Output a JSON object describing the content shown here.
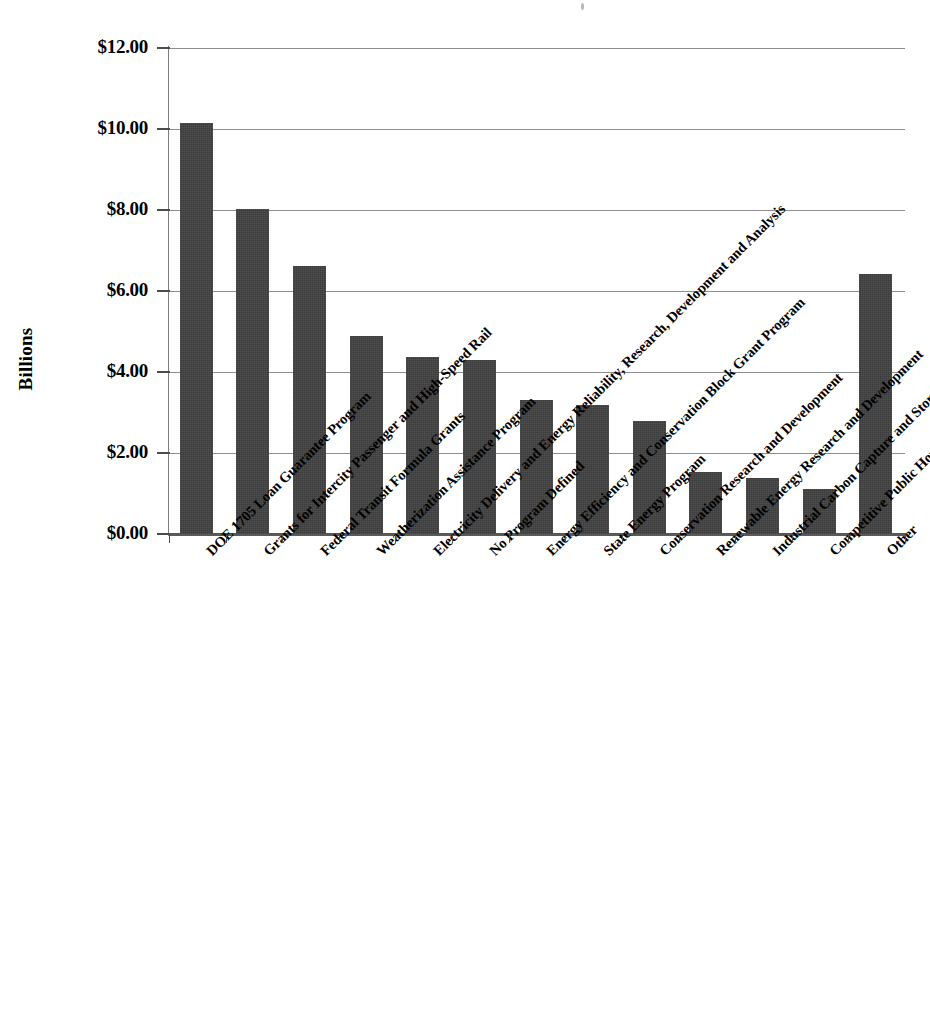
{
  "chart_data": {
    "type": "bar",
    "title": "",
    "subtitle": "",
    "xlabel": "",
    "ylabel": "Billions",
    "ylim": [
      0,
      12
    ],
    "ytick_values": [
      0,
      2,
      4,
      6,
      8,
      10,
      12
    ],
    "ytick_labels": [
      "$0.00",
      "$2.00",
      "$4.00",
      "$6.00",
      "$8.00",
      "$10.00",
      "$12.00"
    ],
    "y_tick_step": 2,
    "grid": true,
    "grid_axis": "y",
    "legend": false,
    "legend_position": "none",
    "bar_color": "#3b3b3b",
    "categories": [
      "DOE 1705 Loan Guarantee Program",
      "Grants for Intercity Passenger and High-Speed Rail",
      "Federal Transit Formula Grants",
      "Weatherization Assistance Program",
      "Electricity Delivery and Energy Reliability, Research, Development and Analysis",
      "No Program Defined",
      "Energy Efficiency and Conservation Block Grant Program",
      "State Energy Program",
      "Conservation Research and Development",
      "Renewable Energy Research and Development",
      "Industrial Carbon Capture and Storage Application",
      "Competitive Public Housing Capital Fund (Recovery Act Funded)",
      "Other"
    ],
    "values": [
      10.15,
      8.02,
      6.62,
      4.88,
      4.36,
      4.29,
      3.3,
      3.19,
      2.8,
      1.54,
      1.39,
      1.1,
      6.43
    ]
  },
  "axis": {
    "y_title": "Billions"
  }
}
